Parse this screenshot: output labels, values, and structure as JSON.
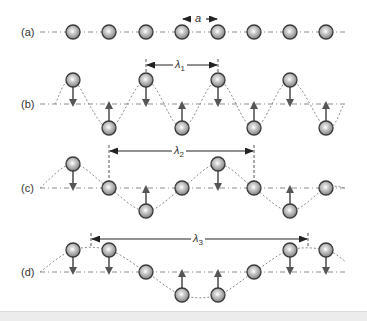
{
  "figure": {
    "colors": {
      "atom_fill_center": "#d8d8d8",
      "atom_fill_edge": "#8a8a8a",
      "atom_stroke": "#3a3a3a",
      "arrow": "#555555",
      "baseline": "#888888",
      "wave": "#888888",
      "text": "#333333"
    },
    "atom_x": [
      73,
      109,
      146,
      182,
      218,
      254,
      290,
      326
    ],
    "rows": [
      {
        "id": "a",
        "label": "(a)",
        "baseline_y": 32,
        "atom_y": [
          32,
          32,
          32,
          32,
          32,
          32,
          32,
          32
        ],
        "arrows": [],
        "dimension": {
          "symbol": "a",
          "subscript": "",
          "x1": 182,
          "x2": 218,
          "y": 19
        }
      },
      {
        "id": "b",
        "label": "(b)",
        "baseline_y": 104,
        "atom_y": [
          80,
          128,
          80,
          128,
          80,
          128,
          80,
          128
        ],
        "arrows": [
          "down",
          "up",
          "down",
          "up",
          "down",
          "up",
          "down",
          "up"
        ],
        "dimension": {
          "symbol": "λ",
          "subscript": "1",
          "x1": 146,
          "x2": 218,
          "y": 65
        }
      },
      {
        "id": "c",
        "label": "(c)",
        "baseline_y": 188,
        "atom_y": [
          164,
          188,
          211,
          188,
          164,
          188,
          211,
          188
        ],
        "arrows": [
          "down",
          "none",
          "up",
          "none",
          "down",
          "none",
          "up",
          "none"
        ],
        "dimension": {
          "symbol": "λ",
          "subscript": "2",
          "x1": 109,
          "x2": 254,
          "y": 151
        }
      },
      {
        "id": "d",
        "label": "(d)",
        "baseline_y": 272,
        "atom_y": [
          250,
          250,
          272,
          295,
          295,
          272,
          250,
          250
        ],
        "arrows": [
          "down",
          "down",
          "none",
          "up",
          "up",
          "none",
          "down",
          "down"
        ],
        "dimension": {
          "symbol": "λ",
          "subscript": "3",
          "x1": 91,
          "x2": 308,
          "y": 239
        }
      }
    ]
  },
  "labels": {
    "row_a": "(a)",
    "row_b": "(b)",
    "row_c": "(c)",
    "row_d": "(d)",
    "spacing_symbol": "a",
    "lambda_symbol": "λ",
    "lambda1_sub": "1",
    "lambda2_sub": "2",
    "lambda3_sub": "3"
  }
}
